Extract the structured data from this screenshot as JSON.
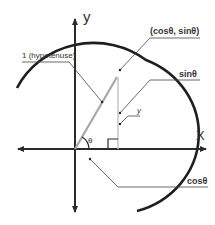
{
  "diagram": {
    "type": "unit-circle-trigonometry",
    "axes": {
      "x_label": "X",
      "y_label": "y"
    },
    "labels": {
      "hypotenuse": "1 (hypotenuse)",
      "point": "(cosθ, sinθ)",
      "sin": "sinθ",
      "y": "y",
      "cos": "cosθ",
      "theta": "θ"
    },
    "colors": {
      "axis": "#2a2a2a",
      "circle": "#1e1e1e",
      "hypotenuse": "#a8a8a8",
      "sine_line": "#c8c8c8",
      "leader": "#444444"
    }
  }
}
